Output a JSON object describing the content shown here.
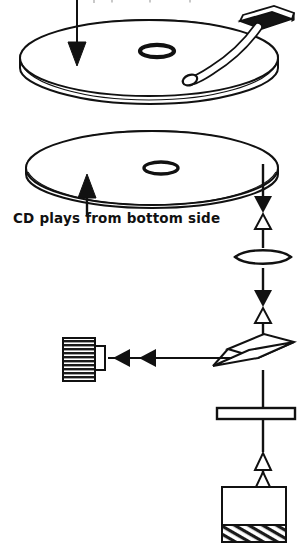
{
  "figure": {
    "type": "technical-line-diagram",
    "ink_color": "#111111",
    "background_color": "#ffffff"
  },
  "captions": {
    "bottom_label": "CD plays from bottom side",
    "top_label": ""
  },
  "annotations": {
    "record_arrow": "down-arrow-icon",
    "cd_arrow": "up-arrow-icon"
  },
  "components": {
    "record": {
      "name": "phonograph-record",
      "center_label": "spindle-hole",
      "tonearm": "tonearm"
    },
    "compact_disc": {
      "name": "compact-disc",
      "center_label": "center-hole"
    },
    "objective_lens": {
      "name": "objective-lens"
    },
    "beam_splitter": {
      "name": "beam-splitter-prism"
    },
    "collimator_lens": {
      "name": "collimator-lens-plate"
    },
    "photodetector": {
      "name": "photodetector"
    },
    "laser_diode": {
      "name": "laser-diode"
    }
  },
  "beam_markers": {
    "outgoing": "filled-triangle-down",
    "reflected": "hollow-triangle-up",
    "detector_path": "filled-triangle-left"
  }
}
